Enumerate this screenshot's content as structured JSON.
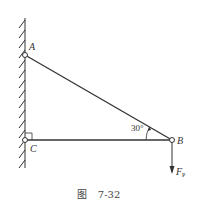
{
  "figure": {
    "caption_prefix": "图",
    "caption_number": "7-32"
  },
  "labels": {
    "point_a": "A",
    "point_b": "B",
    "point_c": "C",
    "angle": "30°",
    "force_main": "F",
    "force_sub": "P"
  },
  "geometry": {
    "wall_x": 25,
    "wall_top": 18,
    "wall_bottom": 168,
    "A": [
      25,
      55
    ],
    "C": [
      25,
      140
    ],
    "B": [
      172,
      140
    ],
    "force_end": [
      172,
      172
    ],
    "angle_deg": 30
  },
  "colors": {
    "line": "#333333",
    "background": "#ffffff"
  }
}
